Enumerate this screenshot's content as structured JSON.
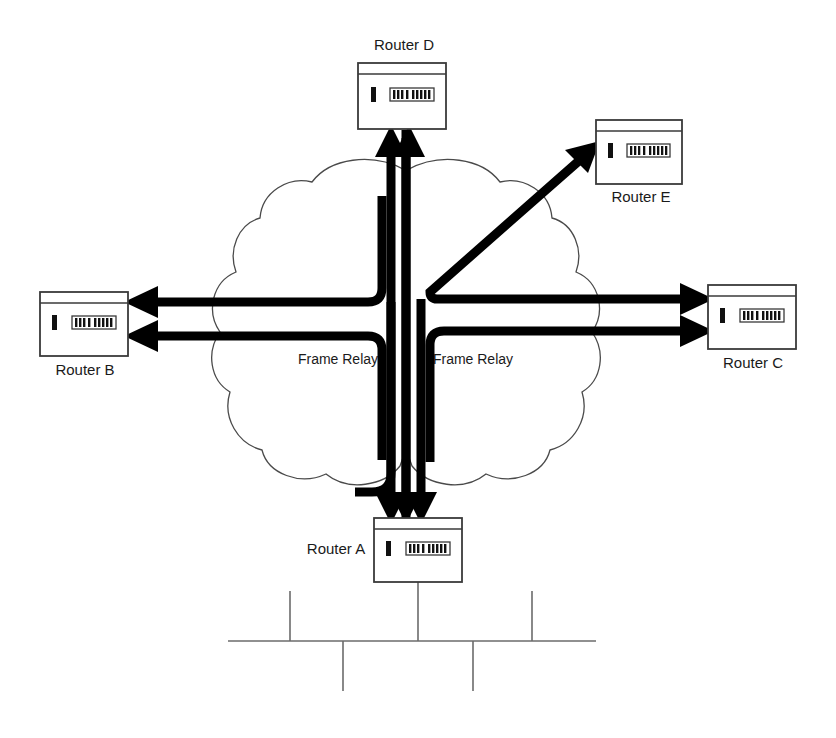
{
  "diagram": {
    "background_color": "#ffffff",
    "line_color": "#000000",
    "cloud_outline_color": "#4a4a4a",
    "lan_color": "#6b6b6b",
    "canvas": {
      "width": 836,
      "height": 738
    }
  },
  "routers": [
    {
      "id": "router-d",
      "label": "Router D",
      "label_position": "above",
      "x": 358,
      "y": 63,
      "w": 88,
      "h": 66,
      "label_x": 404,
      "label_y": 46
    },
    {
      "id": "router-e",
      "label": "Router E",
      "label_position": "below",
      "x": 596,
      "y": 120,
      "w": 86,
      "h": 64,
      "label_x": 641,
      "label_y": 198
    },
    {
      "id": "router-b",
      "label": "Router B",
      "label_position": "below",
      "x": 40,
      "y": 292,
      "w": 88,
      "h": 64,
      "label_x": 85,
      "label_y": 371
    },
    {
      "id": "router-c",
      "label": "Router C",
      "label_position": "below",
      "x": 708,
      "y": 285,
      "w": 88,
      "h": 64,
      "label_x": 753,
      "label_y": 364
    },
    {
      "id": "router-a",
      "label": "Router A",
      "label_position": "left",
      "x": 374,
      "y": 518,
      "w": 88,
      "h": 64,
      "label_x": 336,
      "label_y": 550
    }
  ],
  "clouds": [
    {
      "id": "frame-relay-left",
      "label": "Frame Relay",
      "label_x": 338,
      "label_y": 360
    },
    {
      "id": "frame-relay-right",
      "label": "Frame Relay",
      "label_x": 473,
      "label_y": 360
    }
  ],
  "connections": [
    {
      "id": "a-to-d",
      "from": "Router A",
      "to": "Router D",
      "direction": "up",
      "style": "thick-arrow"
    },
    {
      "id": "b-to-d",
      "from": "Router B",
      "to": "Router D",
      "direction": "up",
      "style": "thick-arrow"
    },
    {
      "id": "hub-to-b-upper",
      "from": "hub",
      "to": "Router B",
      "direction": "left",
      "style": "thick-arrow"
    },
    {
      "id": "hub-to-b-lower",
      "from": "hub",
      "to": "Router B",
      "direction": "left",
      "style": "thick-arrow"
    },
    {
      "id": "hub-to-c-upper",
      "from": "hub",
      "to": "Router C",
      "direction": "right",
      "style": "thick-arrow"
    },
    {
      "id": "hub-to-c-lower",
      "from": "hub",
      "to": "Router C",
      "direction": "right",
      "style": "thick-arrow"
    },
    {
      "id": "hub-to-e",
      "from": "hub",
      "to": "Router E",
      "direction": "diagonal-up-right",
      "style": "thick-arrow"
    },
    {
      "id": "hub-to-a-1",
      "from": "hub",
      "to": "Router A",
      "direction": "down",
      "style": "thick-arrow"
    },
    {
      "id": "hub-to-a-2",
      "from": "hub",
      "to": "Router A",
      "direction": "down",
      "style": "thick-arrow"
    },
    {
      "id": "hub-to-a-3",
      "from": "hub",
      "to": "Router A",
      "direction": "down",
      "style": "thick-arrow"
    }
  ],
  "lan": {
    "id": "router-a-lan",
    "bus_y": 641,
    "bus_x1": 228,
    "bus_x2": 596,
    "drop_x": 418,
    "stubs": [
      {
        "x": 290,
        "dir": "up",
        "len": 50
      },
      {
        "x": 343,
        "dir": "down",
        "len": 50
      },
      {
        "x": 473,
        "dir": "down",
        "len": 50
      },
      {
        "x": 532,
        "dir": "up",
        "len": 50
      }
    ]
  }
}
